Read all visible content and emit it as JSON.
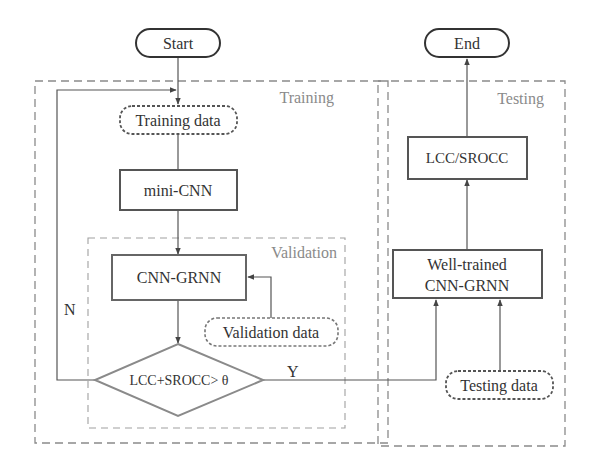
{
  "diagram": {
    "type": "flowchart",
    "groups": {
      "training": {
        "label": "Training"
      },
      "validation": {
        "label": "Validation"
      },
      "testing": {
        "label": "Testing"
      }
    },
    "nodes": {
      "start": {
        "label": "Start",
        "shape": "terminal"
      },
      "end": {
        "label": "End",
        "shape": "terminal"
      },
      "training_data": {
        "label": "Training data",
        "shape": "data-dashed"
      },
      "mini_cnn": {
        "label": "mini-CNN",
        "shape": "process"
      },
      "cnn_grnn": {
        "label": "CNN-GRNN",
        "shape": "process"
      },
      "validation_data": {
        "label": "Validation data",
        "shape": "data-dashed"
      },
      "decision": {
        "label": "LCC+SROCC> θ",
        "shape": "decision"
      },
      "well_trained_line1": {
        "label": "Well-trained"
      },
      "well_trained_line2": {
        "label": "CNN-GRNN"
      },
      "lcc_srocc": {
        "label": "LCC/SROCC",
        "shape": "process"
      },
      "testing_data": {
        "label": "Testing data",
        "shape": "data-dashed"
      }
    },
    "edge_labels": {
      "no": "N",
      "yes": "Y"
    },
    "edges": [
      [
        "Start",
        "Training data"
      ],
      [
        "Training data",
        "mini-CNN"
      ],
      [
        "mini-CNN",
        "CNN-GRNN"
      ],
      [
        "Validation data",
        "CNN-GRNN"
      ],
      [
        "CNN-GRNN",
        "LCC+SROCC> θ"
      ],
      [
        "LCC+SROCC> θ",
        "Training data",
        "N"
      ],
      [
        "LCC+SROCC> θ",
        "Well-trained CNN-GRNN",
        "Y"
      ],
      [
        "Testing data",
        "Well-trained CNN-GRNN"
      ],
      [
        "Well-trained CNN-GRNN",
        "LCC/SROCC"
      ],
      [
        "LCC/SROCC",
        "End"
      ]
    ],
    "colors": {
      "stroke": "#555555",
      "group_border": "#8a8a8a",
      "diamond_stroke": "#8a8a8a",
      "text": "#333333"
    }
  }
}
